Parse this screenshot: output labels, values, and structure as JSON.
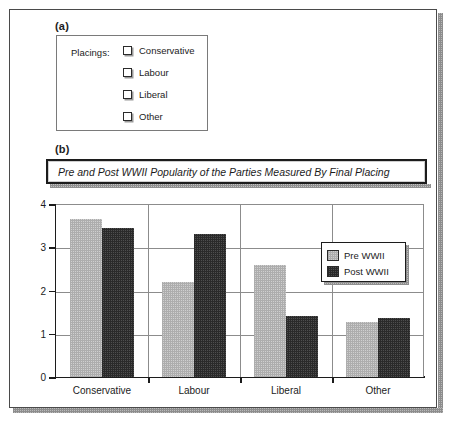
{
  "panels": {
    "a_label": "(a)",
    "b_label": "(b)"
  },
  "placings_panel": {
    "title": "Placings:",
    "options": [
      {
        "label": "Conservative",
        "checked": false,
        "icon": "checkbox-icon"
      },
      {
        "label": "Labour",
        "checked": false,
        "icon": "checkbox-icon"
      },
      {
        "label": "Liberal",
        "checked": false,
        "icon": "checkbox-icon"
      },
      {
        "label": "Other",
        "checked": false,
        "icon": "checkbox-icon"
      }
    ]
  },
  "chart_data": {
    "type": "bar",
    "title": "Pre and Post WWII Popularity of the Parties Measured By Final Placing",
    "categories": [
      "Conservative",
      "Labour",
      "Liberal",
      "Other"
    ],
    "series": [
      {
        "name": "Pre WWII",
        "values": [
          3.65,
          2.2,
          2.6,
          1.28
        ],
        "color": "#cfcfcf"
      },
      {
        "name": "Post WWII",
        "values": [
          3.45,
          3.3,
          1.4,
          1.37
        ],
        "color": "#4e4e4e"
      }
    ],
    "xlabel": "",
    "ylabel": "",
    "ylim": [
      0,
      4
    ],
    "yticks": [
      0,
      1,
      2,
      3,
      4
    ],
    "ytick_labels": [
      "0",
      "1",
      "2",
      "3",
      "4"
    ],
    "grid": true,
    "legend_position": "inside-right"
  }
}
